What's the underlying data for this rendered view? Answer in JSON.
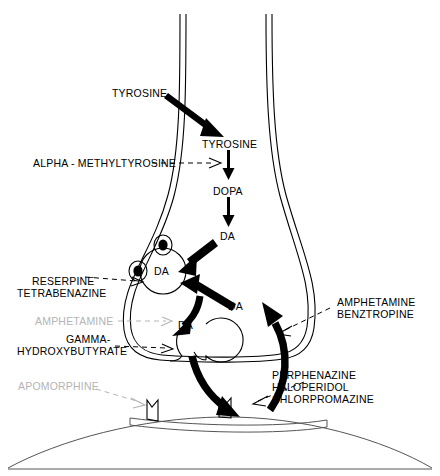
{
  "figure": {
    "type": "biological-pathway-diagram",
    "background_color": "#ffffff",
    "ink_color": "#000000",
    "muted_color": "#b4b4b4"
  },
  "labels": {
    "tyrosine_external": "TYROSINE",
    "tyrosine_internal": "TYROSINE",
    "dopa": "DOPA",
    "da_synth": "DA",
    "da_vesicle": "DA",
    "da_cytosol": "DA",
    "da_cleft": "DA",
    "da_release": "DA",
    "alpha_methyltyrosine": "ALPHA - METHYLTYROSINE",
    "reserpine": "RESERPINE",
    "tetrabenazine": "TETRABENAZINE",
    "amphetamine_left": "AMPHETAMINE",
    "gamma_line1": "GAMMA-",
    "gamma_line2": "HYDROXYBUTYRATE",
    "apomorphine": "APOMORPHINE",
    "amphetamine_right": "AMPHETAMINE",
    "benztropine": "BENZTROPINE",
    "perphenazine": "PERPHENAZINE",
    "haloperidol": "HALOPERIDOL",
    "chlorpromazine": "CHLORPROMAZINE"
  },
  "structures": {
    "axon_terminal": "presynaptic-terminal",
    "storage_vesicle": "storage-vesicle",
    "release_vesicle": "release-vesicle",
    "granule_1": "dense-core-granule",
    "granule_2": "dense-core-granule",
    "postsynaptic_membrane": "postsynaptic-membrane",
    "receptor_left": "dopamine-receptor",
    "receptor_right": "dopamine-receptor"
  },
  "pathway_steps": [
    "TYROSINE",
    "DOPA",
    "DA"
  ]
}
